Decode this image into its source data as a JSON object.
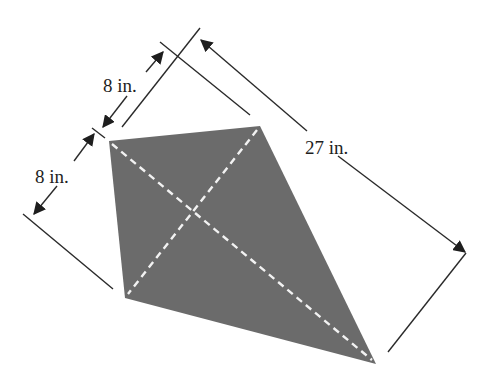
{
  "figure": {
    "type": "kite-with-dimensions",
    "shape_color": "#6b6b6b",
    "diagonal_color": "#f2f2f2",
    "line_color": "#2a2a2a",
    "labels": {
      "upper_short_side": "8 in.",
      "left_short_side": "8 in.",
      "long_diagonal": "27 in."
    },
    "vertices": {
      "top_left": [
        109,
        141
      ],
      "top_right": [
        260,
        126
      ],
      "bottom_left": [
        125,
        298
      ],
      "bottom": [
        376,
        364
      ]
    },
    "diagonals": [
      {
        "from": "top_left",
        "to": "bottom",
        "style": "dashed"
      },
      {
        "from": "top_right",
        "to": "bottom_left",
        "style": "dashed"
      }
    ]
  }
}
